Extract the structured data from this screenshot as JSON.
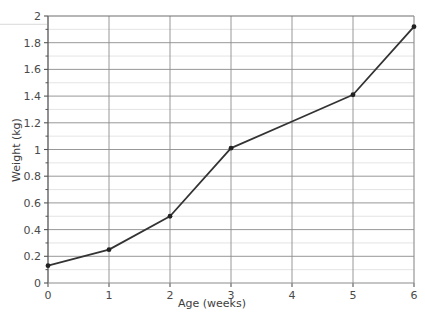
{
  "chart_data": {
    "type": "line",
    "title": "",
    "xlabel": "Age (weeks)",
    "ylabel": "Weight (kg)",
    "xlim": [
      0,
      6
    ],
    "ylim": [
      0,
      2
    ],
    "grid": true,
    "legend": "none",
    "x_ticks": [
      "0",
      "1",
      "2",
      "3",
      "4",
      "5",
      "6"
    ],
    "y_ticks": [
      "0",
      "0.2",
      "0.4",
      "0.6",
      "0.8",
      "1",
      "1.2",
      "1.4",
      "1.6",
      "1.8",
      "2"
    ],
    "x_major_step": 1,
    "y_major_step": 0.2,
    "y_minor_step": 0.1,
    "series": [
      {
        "name": "Weight",
        "color": "#333333",
        "marker": "circle",
        "x": [
          0,
          1,
          2,
          3,
          4,
          5,
          6
        ],
        "values": [
          0.13,
          0.25,
          0.5,
          1.01,
          1.21,
          1.41,
          1.92
        ],
        "labeled_points_x": [
          0,
          1,
          2,
          3,
          5,
          6
        ],
        "labeled_points_y": [
          0.13,
          0.25,
          0.5,
          1.01,
          1.41,
          1.92
        ]
      }
    ]
  },
  "colors": {
    "line": "#333333",
    "marker": "#222222",
    "axis": "#555555",
    "major_grid": "#8c8c8c",
    "minor_grid": "#d9d9d9",
    "text": "#4a4a4a",
    "background": "#ffffff"
  },
  "axes": {
    "x_title": "Age (weeks)",
    "y_title": "Weight (kg)"
  }
}
